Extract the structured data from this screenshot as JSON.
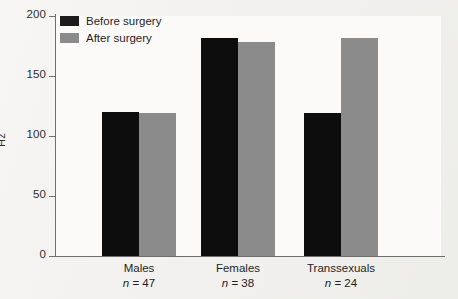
{
  "chart_data": {
    "type": "bar",
    "title": "",
    "subtitle": "",
    "xlabel": "",
    "ylabel": "Hz",
    "ylim": [
      0,
      200
    ],
    "yticks": [
      0,
      50,
      100,
      150,
      200
    ],
    "grid": false,
    "legend_position": "top-left",
    "categories": [
      "Males",
      "Females",
      "Transsexuals"
    ],
    "category_sublabels": [
      "n = 47",
      "n = 38",
      "n = 24"
    ],
    "sample_sizes": [
      47,
      38,
      24
    ],
    "series": [
      {
        "name": "Before surgery",
        "color": "#0d0d0d",
        "values": [
          120,
          182,
          119
        ]
      },
      {
        "name": "After surgery",
        "color": "#8b8b8b",
        "values": [
          119,
          178,
          182
        ]
      }
    ]
  },
  "legend": {
    "items": [
      {
        "label": "Before surgery",
        "swatch": "before"
      },
      {
        "label": "After surgery",
        "swatch": "after"
      }
    ]
  },
  "axis": {
    "y_title": "Hz",
    "y_tick_labels": [
      "200",
      "150",
      "100",
      "50",
      "0"
    ]
  },
  "categories": [
    {
      "label": "Males",
      "n_prefix": "n",
      "n_value": " = 47"
    },
    {
      "label": "Females",
      "n_prefix": "n",
      "n_value": " = 38"
    },
    {
      "label": "Transsexuals",
      "n_prefix": "n",
      "n_value": " = 24"
    }
  ]
}
